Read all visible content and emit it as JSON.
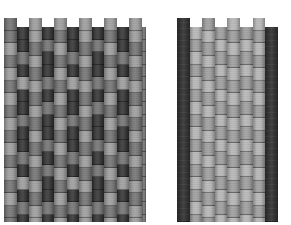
{
  "figure": {
    "colors": {
      "dark": "#2e2e2e",
      "mid": "#6f6f6f",
      "light": "#9a9a9a",
      "pale": "#b3b3b3",
      "edge": "#353535"
    }
  },
  "left_swatch": {
    "x": 4,
    "col_width": 12.5,
    "cell_height": 12.5,
    "raised_top": 18,
    "lowered_top": 27,
    "bottom": 222,
    "columns": [
      {
        "raised": true,
        "pattern": [
          "mid",
          "mid",
          "light",
          "mid",
          "light",
          "mid",
          "light",
          "mid",
          "light",
          "mid",
          "light",
          "mid",
          "light",
          "mid",
          "light",
          "mid",
          "mid"
        ]
      },
      {
        "raised": false,
        "pattern": [
          "dark",
          "dark",
          "mid",
          "dark",
          "light",
          "dark",
          "dark",
          "mid",
          "dark",
          "dark",
          "mid",
          "dark",
          "light",
          "dark",
          "mid",
          "dark"
        ]
      },
      {
        "raised": true,
        "pattern": [
          "light",
          "light",
          "mid",
          "light",
          "mid",
          "light",
          "mid",
          "light",
          "mid",
          "light",
          "mid",
          "light",
          "mid",
          "light",
          "mid",
          "light",
          "light"
        ]
      },
      {
        "raised": false,
        "pattern": [
          "dark",
          "mid",
          "dark",
          "dark",
          "mid",
          "dark",
          "mid",
          "dark",
          "dark",
          "mid",
          "dark",
          "mid",
          "dark",
          "dark",
          "mid",
          "dark"
        ]
      },
      {
        "raised": true,
        "pattern": [
          "light",
          "mid",
          "light",
          "mid",
          "light",
          "mid",
          "light",
          "mid",
          "light",
          "mid",
          "light",
          "mid",
          "light",
          "mid",
          "light",
          "mid",
          "light"
        ]
      },
      {
        "raised": false,
        "pattern": [
          "dark",
          "dark",
          "mid",
          "dark",
          "light",
          "dark",
          "dark",
          "mid",
          "dark",
          "dark",
          "mid",
          "dark",
          "light",
          "dark",
          "mid",
          "dark"
        ]
      },
      {
        "raised": true,
        "pattern": [
          "light",
          "light",
          "mid",
          "light",
          "mid",
          "light",
          "mid",
          "light",
          "mid",
          "light",
          "mid",
          "light",
          "mid",
          "light",
          "mid",
          "light",
          "light"
        ]
      },
      {
        "raised": false,
        "pattern": [
          "dark",
          "mid",
          "dark",
          "dark",
          "mid",
          "dark",
          "mid",
          "dark",
          "dark",
          "mid",
          "dark",
          "mid",
          "dark",
          "dark",
          "mid",
          "dark"
        ]
      },
      {
        "raised": true,
        "pattern": [
          "light",
          "mid",
          "light",
          "mid",
          "light",
          "mid",
          "light",
          "mid",
          "light",
          "mid",
          "light",
          "mid",
          "light",
          "mid",
          "light",
          "mid",
          "light"
        ]
      },
      {
        "raised": false,
        "pattern": [
          "dark",
          "dark",
          "mid",
          "dark",
          "light",
          "dark",
          "dark",
          "mid",
          "dark",
          "dark",
          "mid",
          "dark",
          "light",
          "dark",
          "mid",
          "dark"
        ]
      },
      {
        "raised": true,
        "pattern": [
          "light",
          "light",
          "mid",
          "light",
          "mid",
          "light",
          "mid",
          "light",
          "mid",
          "light",
          "mid",
          "light",
          "mid",
          "light",
          "mid",
          "light",
          "light"
        ]
      },
      {
        "raised": false,
        "pattern": [
          "mid",
          "mid",
          "mid",
          "mid",
          "mid",
          "mid",
          "mid",
          "mid",
          "mid",
          "mid",
          "mid",
          "mid",
          "mid",
          "mid",
          "mid",
          "mid"
        ]
      }
    ]
  },
  "right_swatch": {
    "x": 177,
    "col_width": 12.6,
    "cell_height": 12.5,
    "raised_top": 18,
    "lowered_top": 27,
    "bottom": 222,
    "columns": [
      {
        "raised": true,
        "solid": "edge",
        "length": 16
      },
      {
        "raised": false,
        "pattern": [
          "pale",
          "light",
          "pale",
          "light",
          "pale",
          "light",
          "pale",
          "light",
          "pale",
          "light",
          "pale",
          "light",
          "pale",
          "light",
          "pale",
          "light"
        ]
      },
      {
        "raised": true,
        "pattern": [
          "light",
          "pale",
          "light",
          "pale",
          "light",
          "pale",
          "light",
          "pale",
          "light",
          "pale",
          "light",
          "pale",
          "light",
          "pale",
          "light",
          "pale",
          "light"
        ]
      },
      {
        "raised": false,
        "pattern": [
          "light",
          "pale",
          "light",
          "pale",
          "light",
          "pale",
          "light",
          "pale",
          "light",
          "pale",
          "light",
          "pale",
          "light",
          "pale",
          "light",
          "pale"
        ]
      },
      {
        "raised": true,
        "pattern": [
          "pale",
          "light",
          "pale",
          "light",
          "pale",
          "light",
          "pale",
          "light",
          "pale",
          "light",
          "pale",
          "light",
          "pale",
          "light",
          "pale",
          "light",
          "pale"
        ]
      },
      {
        "raised": false,
        "pattern": [
          "light",
          "pale",
          "light",
          "pale",
          "light",
          "pale",
          "light",
          "pale",
          "light",
          "pale",
          "light",
          "pale",
          "light",
          "pale",
          "light",
          "pale"
        ]
      },
      {
        "raised": true,
        "pattern": [
          "pale",
          "light",
          "pale",
          "light",
          "pale",
          "light",
          "pale",
          "light",
          "pale",
          "light",
          "pale",
          "light",
          "pale",
          "light",
          "pale",
          "light",
          "pale"
        ]
      },
      {
        "raised": false,
        "solid": "edge",
        "length": 16
      }
    ]
  }
}
